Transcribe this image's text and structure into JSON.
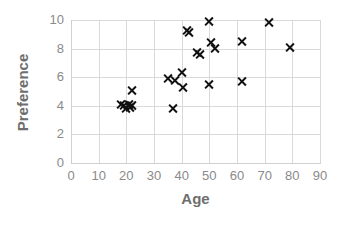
{
  "chart_data": {
    "type": "scatter",
    "title": "",
    "xlabel": "Age",
    "ylabel": "Preference",
    "xlim": [
      0,
      90
    ],
    "ylim": [
      0,
      10
    ],
    "xticks": [
      0,
      10,
      20,
      30,
      40,
      50,
      60,
      70,
      80,
      90
    ],
    "yticks": [
      0,
      2,
      4,
      6,
      8,
      10
    ],
    "grid": true,
    "legend": false,
    "marker": "x",
    "marker_color": "#111111",
    "grid_color": "#d9d9d9",
    "tick_label_color": "#8a8a8a",
    "axis_title_color": "#6e6e6e",
    "background": "#ffffff",
    "series": [
      {
        "name": "Preference vs Age",
        "points": [
          {
            "x": 18,
            "y": 4.1
          },
          {
            "x": 19,
            "y": 4.0
          },
          {
            "x": 20,
            "y": 3.8
          },
          {
            "x": 21,
            "y": 4.1
          },
          {
            "x": 21.5,
            "y": 3.9
          },
          {
            "x": 22,
            "y": 4.0
          },
          {
            "x": 22,
            "y": 5.1
          },
          {
            "x": 35,
            "y": 5.9
          },
          {
            "x": 37,
            "y": 3.8
          },
          {
            "x": 37.5,
            "y": 5.8
          },
          {
            "x": 40,
            "y": 6.3
          },
          {
            "x": 40.5,
            "y": 5.3
          },
          {
            "x": 42,
            "y": 9.3
          },
          {
            "x": 42.5,
            "y": 9.1
          },
          {
            "x": 45.5,
            "y": 7.7
          },
          {
            "x": 46.5,
            "y": 7.6
          },
          {
            "x": 50,
            "y": 9.9
          },
          {
            "x": 50,
            "y": 5.5
          },
          {
            "x": 50.5,
            "y": 8.4
          },
          {
            "x": 52,
            "y": 8.0
          },
          {
            "x": 62,
            "y": 8.5
          },
          {
            "x": 62,
            "y": 5.7
          },
          {
            "x": 71.5,
            "y": 9.8
          },
          {
            "x": 79,
            "y": 8.1
          }
        ]
      }
    ]
  }
}
